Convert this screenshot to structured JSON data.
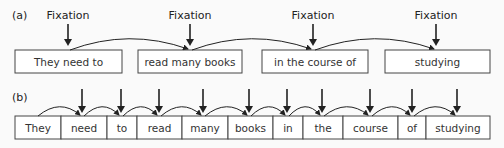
{
  "panel_a": {
    "label": "(a)",
    "fixation_label": "Fixation",
    "chunks": [
      {
        "text": "They need to",
        "x": 15,
        "w": 107
      },
      {
        "text": "read many books",
        "x": 138,
        "w": 104
      },
      {
        "text": "in the course of",
        "x": 262,
        "w": 106
      },
      {
        "text": "studying",
        "x": 385,
        "w": 105
      }
    ],
    "fixations_x": [
      68,
      190,
      313,
      436
    ]
  },
  "panel_b": {
    "label": "(b)",
    "words": [
      {
        "text": "They",
        "x": 15,
        "w": 46
      },
      {
        "text": "need",
        "x": 61,
        "w": 46
      },
      {
        "text": "to",
        "x": 107,
        "w": 30
      },
      {
        "text": "read",
        "x": 137,
        "w": 45
      },
      {
        "text": "many",
        "x": 182,
        "w": 46
      },
      {
        "text": "books",
        "x": 228,
        "w": 45
      },
      {
        "text": "in",
        "x": 273,
        "w": 30
      },
      {
        "text": "the",
        "x": 303,
        "w": 40
      },
      {
        "text": "course",
        "x": 343,
        "w": 55
      },
      {
        "text": "of",
        "x": 398,
        "w": 28
      },
      {
        "text": "studying",
        "x": 426,
        "w": 64
      }
    ],
    "fixations_x": [
      82,
      121,
      159,
      203,
      249,
      287,
      322,
      370,
      412,
      457
    ]
  }
}
